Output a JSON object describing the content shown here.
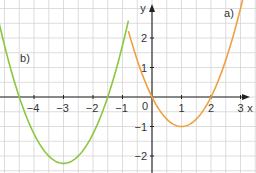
{
  "chart_data": {
    "type": "line",
    "title": "",
    "xlabel": "x",
    "ylabel": "y",
    "xlim": [
      -5.2,
      3.5
    ],
    "ylim": [
      -2.6,
      3.3
    ],
    "grid": true,
    "x_ticks": [
      "-4",
      "-3",
      "-2",
      "-1",
      "0",
      "1",
      "2",
      "3"
    ],
    "y_ticks": [
      "-2",
      "-1",
      "1",
      "2"
    ],
    "origin_label": "0",
    "series": [
      {
        "name": "a)",
        "formula": "y = x^2 - 2x",
        "color": "#f0a040",
        "x": [
          -0.8,
          -0.5,
          0,
          0.5,
          1,
          1.5,
          2,
          2.5,
          3,
          3.2
        ],
        "y": [
          2.24,
          1.25,
          0,
          -0.75,
          -1,
          -0.75,
          0,
          1.25,
          3,
          3.84
        ]
      },
      {
        "name": "b)",
        "formula": "y = (x+3)^2 - 2.25",
        "color": "#8cc63f",
        "x": [
          -5.2,
          -4.5,
          -4,
          -3.5,
          -3,
          -2.5,
          -2,
          -1.5,
          -1,
          -0.8
        ],
        "y": [
          2.59,
          0,
          -1.25,
          -2,
          -2.25,
          -2,
          -1.25,
          0,
          1.75,
          2.59
        ]
      }
    ]
  }
}
